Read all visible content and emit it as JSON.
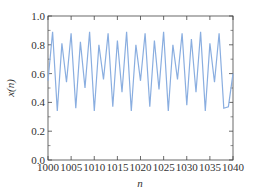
{
  "chart_data": {
    "type": "line",
    "title": "",
    "xlabel": "n",
    "ylabel": "x(n)",
    "xlim": [
      1000,
      1040
    ],
    "ylim": [
      0.0,
      1.0
    ],
    "grid": false,
    "legend": null,
    "x_ticks": [
      "1000",
      "1005",
      "1010",
      "1015",
      "1020",
      "1025",
      "1030",
      "1035",
      "1040"
    ],
    "y_ticks": [
      "0.0",
      "0.2",
      "0.4",
      "0.6",
      "0.8",
      "1.0"
    ],
    "series": [
      {
        "name": "x(n)",
        "color": "#8aaee0",
        "x": [
          1000,
          1001,
          1002,
          1003,
          1004,
          1005,
          1006,
          1007,
          1008,
          1009,
          1010,
          1011,
          1012,
          1013,
          1014,
          1015,
          1016,
          1017,
          1018,
          1019,
          1020,
          1021,
          1022,
          1023,
          1024,
          1025,
          1026,
          1027,
          1028,
          1029,
          1030,
          1031,
          1032,
          1033,
          1034,
          1035,
          1036,
          1037,
          1038,
          1039,
          1040
        ],
        "values": [
          0.55,
          0.89,
          0.34,
          0.81,
          0.54,
          0.88,
          0.36,
          0.82,
          0.5,
          0.89,
          0.34,
          0.8,
          0.56,
          0.88,
          0.37,
          0.83,
          0.47,
          0.89,
          0.34,
          0.8,
          0.55,
          0.88,
          0.37,
          0.83,
          0.49,
          0.89,
          0.34,
          0.8,
          0.56,
          0.88,
          0.38,
          0.84,
          0.47,
          0.89,
          0.34,
          0.81,
          0.54,
          0.88,
          0.36,
          0.37,
          0.6
        ]
      }
    ]
  }
}
